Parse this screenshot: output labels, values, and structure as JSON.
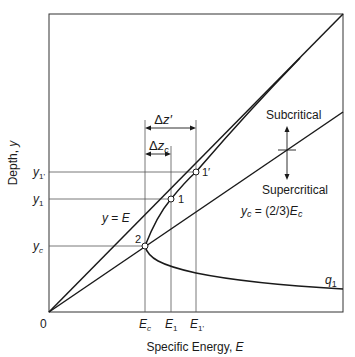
{
  "diagram": {
    "axes": {
      "xlabel_text": "Specific Energy, ",
      "xlabel_var": "E",
      "ylabel_text": "Depth, ",
      "ylabel_var": "y",
      "origin_label": "0"
    },
    "x_ticks": {
      "Ec": {
        "main": "E",
        "sub": "c"
      },
      "E1": {
        "main": "E",
        "sub": "1"
      },
      "E1p": {
        "main": "E",
        "sub": "1'"
      }
    },
    "y_ticks": {
      "y1p": {
        "main": "y",
        "sub": "1'"
      },
      "y1": {
        "main": "y",
        "sub": "1"
      },
      "yc": {
        "main": "y",
        "sub": "c"
      }
    },
    "points": {
      "p1": "1",
      "p1p": "1′",
      "p2": "2"
    },
    "annotations": {
      "dz_prime": {
        "delta": "Δ",
        "var": "z′"
      },
      "dz_c": {
        "delta": "Δ",
        "var": "z",
        "sub": "c"
      },
      "subcritical": "Subcritical",
      "supercritical": "Supercritical",
      "line_yE": {
        "lhs": "y",
        "eq": " = ",
        "rhs": "E"
      },
      "line_yc": {
        "lhs": "y",
        "lhs_sub": "c",
        "eq": " = (2/3)",
        "rhs": "E",
        "rhs_sub": "c"
      },
      "curve_q1": {
        "main": "q",
        "sub": "1"
      }
    },
    "colors": {
      "line": "#1a1a1a",
      "guide": "#555555",
      "background": "#ffffff"
    }
  }
}
